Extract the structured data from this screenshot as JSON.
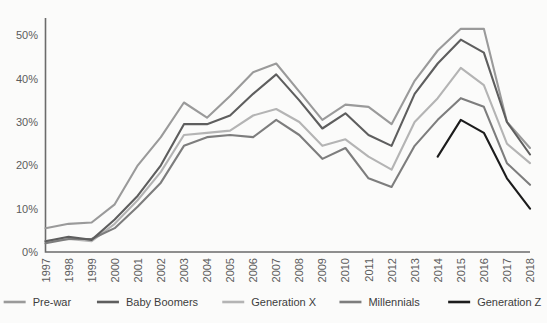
{
  "chart_data": {
    "type": "line",
    "title": "",
    "subtitle": "",
    "xlabel": "",
    "ylabel": "",
    "grid": false,
    "legend_position": "bottom",
    "x": [
      1997,
      1998,
      1999,
      2000,
      2001,
      2002,
      2003,
      2004,
      2005,
      2006,
      2007,
      2008,
      2009,
      2010,
      2011,
      2012,
      2013,
      2014,
      2015,
      2016,
      2017,
      2018
    ],
    "xtick_labels": [
      "1997",
      "1998",
      "1999",
      "2000",
      "2001",
      "2002",
      "2003",
      "2004",
      "2005",
      "2006",
      "2007",
      "2008",
      "2009",
      "2010",
      "2011",
      "2012",
      "2013",
      "2014",
      "2015",
      "2016",
      "2017",
      "2018"
    ],
    "ytick_labels": [
      "0%",
      "10%",
      "20%",
      "30%",
      "40%",
      "50%"
    ],
    "yticks": [
      0,
      10,
      20,
      30,
      40,
      50
    ],
    "ylim": [
      0,
      54
    ],
    "xlim": [
      1997,
      2018
    ],
    "series": [
      {
        "name": "Pre-war",
        "color": "#9a9a9a",
        "values": [
          5.5,
          6.5,
          6.8,
          11.0,
          20.0,
          26.5,
          34.5,
          31.0,
          36.0,
          41.5,
          43.5,
          37.0,
          30.5,
          34.0,
          33.5,
          29.5,
          39.5,
          46.5,
          51.5,
          51.5,
          30.0,
          24.0
        ]
      },
      {
        "name": "Baby Boomers",
        "color": "#5e5e5e",
        "values": [
          2.5,
          3.5,
          2.8,
          7.5,
          13.0,
          20.0,
          29.5,
          29.5,
          31.5,
          36.5,
          41.0,
          35.0,
          28.5,
          32.0,
          27.0,
          24.5,
          36.5,
          43.5,
          49.0,
          46.0,
          30.0,
          22.5
        ]
      },
      {
        "name": "Generation X",
        "color": "#b4b4b4",
        "values": [
          2.5,
          3.0,
          2.5,
          6.5,
          12.0,
          18.5,
          27.0,
          27.5,
          28.0,
          31.5,
          33.0,
          30.0,
          24.5,
          26.0,
          22.0,
          19.0,
          30.0,
          35.5,
          42.5,
          38.5,
          25.0,
          20.5
        ]
      },
      {
        "name": "Millennials",
        "color": "#7d7d7d",
        "values": [
          2.0,
          3.0,
          3.0,
          5.5,
          10.5,
          16.0,
          24.5,
          26.5,
          27.0,
          26.5,
          30.5,
          27.0,
          21.5,
          24.0,
          17.0,
          15.0,
          24.5,
          30.5,
          35.5,
          33.5,
          20.5,
          15.5
        ]
      },
      {
        "name": "Generation Z",
        "color": "#1c1c1c",
        "values": [
          null,
          null,
          null,
          null,
          null,
          null,
          null,
          null,
          null,
          null,
          null,
          null,
          null,
          null,
          null,
          null,
          null,
          22.0,
          30.5,
          27.5,
          17.0,
          10.0
        ]
      }
    ]
  },
  "legend": {
    "items": [
      {
        "label": "Pre-war",
        "color": "#9a9a9a"
      },
      {
        "label": "Baby Boomers",
        "color": "#5e5e5e"
      },
      {
        "label": "Generation X",
        "color": "#b4b4b4"
      },
      {
        "label": "Millennials",
        "color": "#7d7d7d"
      },
      {
        "label": "Generation Z",
        "color": "#1c1c1c"
      }
    ]
  }
}
